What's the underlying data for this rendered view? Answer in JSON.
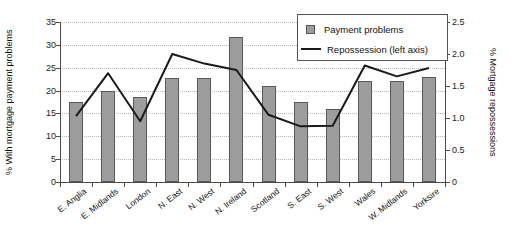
{
  "chart_data": {
    "type": "bar",
    "title": "",
    "categories": [
      "E. Anglia",
      "E. Midlands",
      "London",
      "N. East",
      "N. West",
      "N. Ireland",
      "Scotland",
      "S. East",
      "S. West",
      "Wales",
      "W. Midlands",
      "Yorksire"
    ],
    "series": [
      {
        "name": "Payment problems",
        "type": "bar",
        "axis": "left",
        "values": [
          17.5,
          20.0,
          18.7,
          22.8,
          22.8,
          31.7,
          20.9,
          17.4,
          16.0,
          22.2,
          22.0,
          23.0
        ]
      },
      {
        "name": "Repossession (left axis)",
        "type": "line",
        "axis": "right",
        "values": [
          1.03,
          1.7,
          0.95,
          2.0,
          1.85,
          1.75,
          1.05,
          0.87,
          0.88,
          1.82,
          1.65,
          1.78
        ]
      }
    ],
    "xlabel": "",
    "ylabel": "% With mortgage payment problems",
    "y2label": "% Mortgage repossessions",
    "ylim": [
      0,
      35
    ],
    "y2lim": [
      0,
      2.5
    ],
    "yticks": [
      "0",
      "5",
      "10",
      "15",
      "20",
      "25",
      "30",
      "35"
    ],
    "y2ticks": [
      "0",
      "0.5",
      "1.0",
      "1.5",
      "2.0",
      "2.5"
    ],
    "grid": true,
    "legend_position": "top-right",
    "colors": {
      "bar_fill": "#9d9d9d",
      "bar_border": "#595959",
      "line": "#1a1a1a",
      "grid": "#b9b9b9",
      "axis": "#4a4a4a"
    }
  },
  "legend": {
    "items": [
      {
        "label": "Payment problems",
        "marker": "square"
      },
      {
        "label": "Repossession (left axis)",
        "marker": "line"
      }
    ]
  }
}
